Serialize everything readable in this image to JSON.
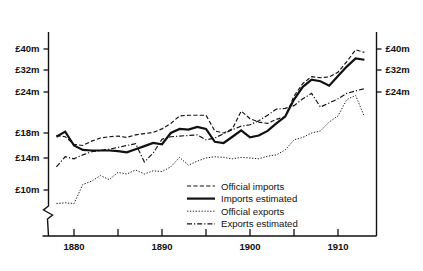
{
  "chart_data": {
    "type": "line",
    "title": "",
    "subtitle": "",
    "xlabel": "",
    "ylabel": "",
    "grid": false,
    "legend_position": "inside-bottom-center",
    "axis_break": true,
    "axis_break_note": "break in vertical axis below lowest gridline",
    "xlim": [
      1878,
      1913
    ],
    "x_ticks_major": [
      1880,
      1890,
      1900,
      1910
    ],
    "x_ticks_minor": [
      1885,
      1895,
      1905
    ],
    "x_tick_labels": [
      "1880",
      "1890",
      "1900",
      "1910"
    ],
    "ylim": [
      8,
      44
    ],
    "y_ticks_left": [
      10,
      14,
      18,
      24,
      32,
      40
    ],
    "y_tick_labels_left": [
      "£10m",
      "£14m",
      "£18m",
      "£24m",
      "£32m",
      "£40m"
    ],
    "y_ticks_right": [
      24,
      32,
      40
    ],
    "y_tick_labels_right": [
      "£24m",
      "£32m",
      "£40m"
    ],
    "y_unit": "£ million",
    "x": [
      1878,
      1879,
      1880,
      1881,
      1882,
      1883,
      1884,
      1885,
      1886,
      1887,
      1888,
      1889,
      1890,
      1891,
      1892,
      1893,
      1894,
      1895,
      1896,
      1897,
      1898,
      1899,
      1900,
      1901,
      1902,
      1903,
      1904,
      1905,
      1906,
      1907,
      1908,
      1909,
      1910,
      1911,
      1912,
      1913
    ],
    "series": [
      {
        "name": "Official imports",
        "style": "dashed",
        "values": [
          17.6,
          17.4,
          16.2,
          16.0,
          16.7,
          17.2,
          17.4,
          17.5,
          17.3,
          17.7,
          17.9,
          18.1,
          18.6,
          19.4,
          20.5,
          20.6,
          20.6,
          20.6,
          18.3,
          18.0,
          18.6,
          21.2,
          20.1,
          19.6,
          19.4,
          20.0,
          20.4,
          23.4,
          27.1,
          29.6,
          29.2,
          29.5,
          31.2,
          35.2,
          39.7,
          38.7
        ]
      },
      {
        "name": "Imports estimated",
        "style": "solid",
        "values": [
          17.4,
          18.2,
          16.0,
          15.3,
          15.2,
          15.2,
          15.2,
          15.1,
          14.9,
          15.4,
          15.9,
          16.4,
          16.2,
          18.0,
          18.6,
          18.5,
          18.9,
          18.6,
          16.6,
          16.4,
          17.4,
          18.4,
          17.3,
          17.6,
          18.3,
          19.4,
          20.4,
          22.9,
          25.9,
          28.5,
          27.9,
          26.3,
          29.8,
          33.3,
          36.4,
          35.9
        ]
      },
      {
        "name": "Official exports",
        "style": "dotted",
        "values": [
          8.3,
          8.4,
          8.3,
          10.7,
          11.1,
          11.8,
          11.3,
          12.2,
          12.0,
          12.5,
          12.0,
          12.4,
          12.3,
          12.9,
          14.1,
          13.1,
          13.6,
          14.0,
          14.2,
          14.1,
          13.9,
          14.1,
          14.0,
          13.9,
          14.3,
          14.5,
          15.3,
          16.9,
          17.3,
          18.0,
          18.3,
          19.6,
          20.5,
          22.9,
          23.5,
          20.4
        ]
      },
      {
        "name": "Exports estimated",
        "style": "dash-dot",
        "values": [
          12.9,
          14.2,
          13.9,
          14.5,
          15.0,
          15.2,
          15.4,
          15.7,
          16.0,
          16.3,
          13.5,
          14.8,
          17.0,
          17.4,
          17.5,
          17.6,
          17.7,
          16.9,
          17.2,
          17.9,
          18.5,
          19.0,
          19.2,
          19.8,
          20.6,
          21.5,
          21.6,
          22.0,
          23.0,
          23.8,
          21.8,
          22.4,
          23.0,
          23.8,
          24.4,
          25.2
        ]
      }
    ],
    "legend": [
      {
        "label": "Official imports",
        "style": "dashed"
      },
      {
        "label": "Imports estimated",
        "style": "solid"
      },
      {
        "label": "Official exports",
        "style": "dotted"
      },
      {
        "label": "Exports estimated",
        "style": "dash-dot"
      }
    ],
    "colors": {
      "ink": "#111111",
      "background": "#ffffff"
    }
  }
}
